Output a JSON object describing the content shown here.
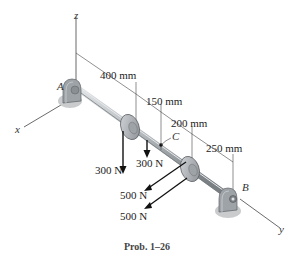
{
  "diagram": {
    "type": "3d-shaft-free-body",
    "axes": {
      "z": "z",
      "x": "x",
      "y": "y"
    },
    "supports": {
      "A": "A",
      "B": "B"
    },
    "point_c": "C",
    "dimensions": [
      "400 mm",
      "150 mm",
      "200 mm",
      "250 mm"
    ],
    "forces": [
      {
        "label": "300 N",
        "direction": "-z"
      },
      {
        "label": "300 N",
        "direction": "-z"
      },
      {
        "label": "500 N",
        "direction": "+x"
      },
      {
        "label": "500 N",
        "direction": "+x"
      }
    ],
    "caption": "Prob. 1–26"
  },
  "colors": {
    "shaft": "#b8bcc0",
    "shaft_dark": "#7d8287",
    "support": "#9ea3a8",
    "shadow": "#c9cbcd",
    "line": "#333333"
  }
}
